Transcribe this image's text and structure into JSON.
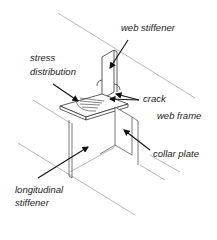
{
  "diagram": {
    "labels": {
      "web_stiffener": "web stiffener",
      "stress_line1": "stress",
      "stress_line2": "distribution",
      "crack": "crack",
      "web_frame": "web frame",
      "collar_plate": "collar plate",
      "longitudinal_line1": "longitudinal",
      "longitudinal_line2": "stiffener"
    },
    "colors": {
      "line": "#333333",
      "light_line": "#999999",
      "arrow": "#111111",
      "text": "#1a1a1a"
    }
  }
}
